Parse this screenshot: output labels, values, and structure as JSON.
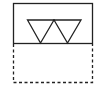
{
  "diagram": {
    "stroke_color": "#222222",
    "background": "#ffffff",
    "shapes": [
      {
        "name": "solid-box",
        "type": "rect",
        "style": "solid"
      },
      {
        "name": "triangle-left",
        "type": "inverted-triangle"
      },
      {
        "name": "triangle-right",
        "type": "inverted-triangle"
      },
      {
        "name": "dashed-box",
        "type": "rect",
        "style": "dashed"
      }
    ]
  }
}
